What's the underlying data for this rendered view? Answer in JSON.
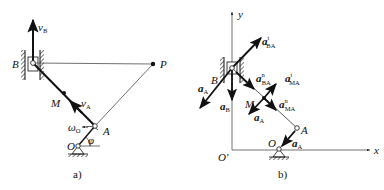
{
  "figure_a": {
    "caption": "a)",
    "labels": {
      "B": "B",
      "P": "P",
      "M": "M",
      "A": "A",
      "O": "O",
      "vB": "v",
      "vB_sub": "B",
      "vA": "v",
      "vA_sub": "A",
      "omega": "ω",
      "omega_sub": "O",
      "phi": "φ"
    }
  },
  "figure_b": {
    "caption": "b)",
    "axes": {
      "x": "x",
      "y": "y",
      "origin": "O′"
    },
    "labels": {
      "B": "B",
      "M": "M",
      "A": "A",
      "O": "O",
      "aBA_t": "a",
      "aBA_t_sub": "BA",
      "aBA_t_sup": "t",
      "aBA_n": "a",
      "aBA_n_sub": "BA",
      "aBA_n_sup": "n",
      "aMA_t": "a",
      "aMA_t_sub": "MA",
      "aMA_t_sup": "t",
      "aMA_n": "a",
      "aMA_n_sub": "MA",
      "aMA_n_sup": "n",
      "aA_B": "a",
      "aA_B_sub": "A",
      "aB": "a",
      "aB_sub": "B",
      "aA_M": "a",
      "aA_M_sub": "A",
      "aA_A": "a",
      "aA_A_sub": "A"
    }
  }
}
